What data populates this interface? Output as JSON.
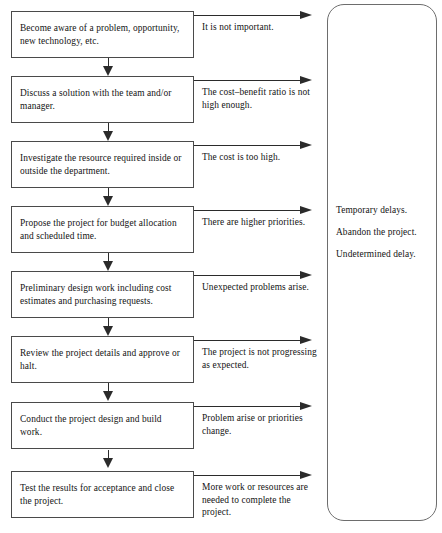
{
  "diagram": {
    "type": "project-lifecycle-flowchart",
    "orientation": "vertical",
    "steps": [
      {
        "id": "step-1",
        "text": "Become aware of a problem, opportunity, new technology, etc.",
        "exit_condition": "It is not important."
      },
      {
        "id": "step-2",
        "text": "Discuss a solution with the team and/or manager.",
        "exit_condition": "The cost–benefit ratio is not high enough."
      },
      {
        "id": "step-3",
        "text": "Investigate the resource required inside or outside the department.",
        "exit_condition": "The cost is too high."
      },
      {
        "id": "step-4",
        "text": "Propose the project for budget allocation and scheduled time.",
        "exit_condition": "There are higher priorities."
      },
      {
        "id": "step-5",
        "text": "Preliminary design work including cost estimates and purchasing requests.",
        "exit_condition": "Unexpected problems arise."
      },
      {
        "id": "step-6",
        "text": "Review the project details and approve or halt.",
        "exit_condition": "The project is not progressing as expected."
      },
      {
        "id": "step-7",
        "text": "Conduct the project design and build work.",
        "exit_condition": "Problem arise or priorities change."
      },
      {
        "id": "step-8",
        "text": "Test the results for acceptance and close the project.",
        "exit_condition": "More work or resources are needed to complete the project."
      }
    ],
    "outcomes": {
      "items": [
        "Temporary delays.",
        "Abandon the project.",
        "Undetermined delay."
      ]
    },
    "colors": {
      "box_border": "#4a4a4a",
      "arrow": "#2b2b2b",
      "container_border": "#6d6d6d",
      "text": "#141414",
      "background": "#ffffff"
    }
  }
}
